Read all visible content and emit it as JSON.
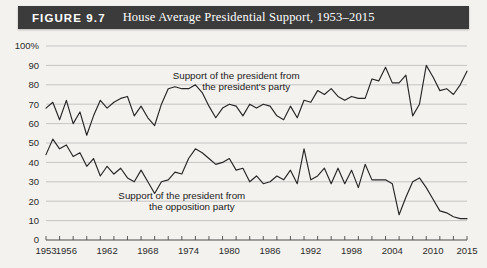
{
  "figure": {
    "label": "FIGURE 9.7",
    "title": "House Average Presidential Support, 1953–2015",
    "banner_color": "#3b3b3b",
    "banner_text_color": "#ffffff"
  },
  "page": {
    "background_color": "#f4f2ee"
  },
  "chart_data": {
    "type": "line",
    "title": "House Average Presidential Support, 1953–2015",
    "xlabel": "",
    "ylabel": "",
    "xlim": [
      1953,
      2015
    ],
    "ylim": [
      0,
      100
    ],
    "ytick_labels": [
      "100%",
      "90",
      "80",
      "70",
      "60",
      "50",
      "40",
      "30",
      "20",
      "10",
      "0"
    ],
    "ytick_values": [
      100,
      90,
      80,
      70,
      60,
      50,
      40,
      30,
      20,
      10,
      0
    ],
    "xtick_labels": [
      "1953",
      "1956",
      "1962",
      "1968",
      "1974",
      "1980",
      "1986",
      "1992",
      "1998",
      "2004",
      "2010",
      "2015"
    ],
    "xtick_values": [
      1953,
      1956,
      1962,
      1968,
      1974,
      1980,
      1986,
      1992,
      1998,
      2004,
      2010,
      2015
    ],
    "minor_xtick_step": 2,
    "grid": true,
    "grid_axis": "y",
    "legend": "none",
    "line_color": "#262626",
    "annotations": [
      {
        "name": "presidents-party-annotation",
        "line1": "Support of the president from",
        "line2": "the president's party",
        "x": 1981,
        "y": 83
      },
      {
        "name": "opposition-party-annotation",
        "line1": "Support of the president from",
        "line2": "the opposition party",
        "x": 1973,
        "y": 21
      }
    ],
    "x": [
      1953,
      1954,
      1955,
      1956,
      1957,
      1958,
      1959,
      1960,
      1961,
      1962,
      1963,
      1964,
      1965,
      1966,
      1967,
      1968,
      1969,
      1970,
      1971,
      1972,
      1973,
      1974,
      1975,
      1976,
      1977,
      1978,
      1979,
      1980,
      1981,
      1982,
      1983,
      1984,
      1985,
      1986,
      1987,
      1988,
      1989,
      1990,
      1991,
      1992,
      1993,
      1994,
      1995,
      1996,
      1997,
      1998,
      1999,
      2000,
      2001,
      2002,
      2003,
      2004,
      2005,
      2006,
      2007,
      2008,
      2009,
      2010,
      2011,
      2012,
      2013,
      2014,
      2015
    ],
    "series": [
      {
        "name": "Support of the president from the president's party",
        "values": [
          68,
          71,
          62,
          72,
          60,
          66,
          54,
          64,
          72,
          68,
          71,
          73,
          74,
          64,
          69,
          63,
          59,
          70,
          78,
          79,
          78,
          78,
          80,
          76,
          69,
          63,
          68,
          70,
          69,
          64,
          70,
          68,
          70,
          69,
          64,
          62,
          69,
          63,
          72,
          71,
          77,
          75,
          78,
          74,
          72,
          74,
          73,
          73,
          83,
          82,
          89,
          81,
          81,
          85,
          64,
          70,
          90,
          84,
          77,
          78,
          75,
          80,
          87
        ]
      },
      {
        "name": "Support of the president from the opposition party",
        "values": [
          44,
          52,
          47,
          49,
          43,
          45,
          38,
          42,
          33,
          38,
          34,
          37,
          32,
          30,
          36,
          30,
          24,
          30,
          31,
          35,
          34,
          42,
          47,
          45,
          42,
          39,
          40,
          42,
          36,
          37,
          30,
          33,
          29,
          30,
          33,
          31,
          36,
          29,
          47,
          31,
          33,
          37,
          29,
          37,
          29,
          36,
          27,
          39,
          31,
          31,
          31,
          29,
          13,
          22,
          30,
          32,
          27,
          21,
          15,
          14,
          12,
          11,
          11
        ]
      }
    ]
  }
}
